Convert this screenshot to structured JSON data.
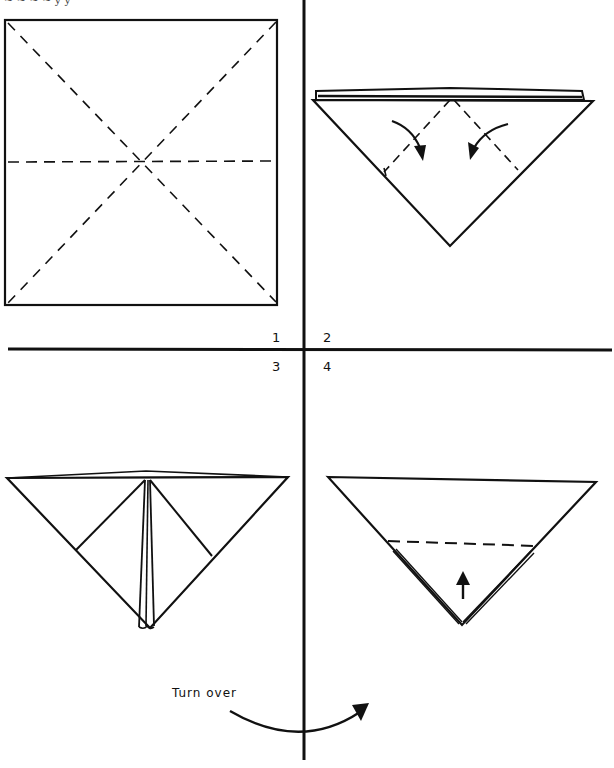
{
  "page": {
    "type": "origami instruction diagram",
    "top_fragment_text": "~ ~ ~ ~ y y"
  },
  "steps": [
    {
      "number": "1",
      "description": "Square with dashed diagonal and horizontal crease lines"
    },
    {
      "number": "2",
      "description": "Triangle with two dashed fold lines and curved arrows folding flaps toward center"
    },
    {
      "number": "3",
      "description": "Triangle with flaps folded to center line"
    },
    {
      "number": "4",
      "description": "Triangle with horizontal dashed fold line and upward arrow"
    }
  ],
  "annotations": {
    "turn_over": "Turn over"
  },
  "colors": {
    "line": "#111111",
    "background": "#ffffff"
  }
}
